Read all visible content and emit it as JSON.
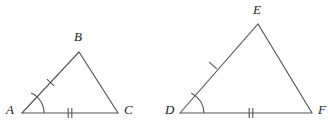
{
  "figure": {
    "canvas": {
      "width": 331,
      "height": 129
    },
    "stroke_color": "#555555",
    "label_color": "#1b1b1b",
    "background_color": "#ffffff",
    "stroke_width": 1.1
  },
  "triangles": [
    {
      "name": "triangle-abc",
      "vertices": [
        {
          "label": "A",
          "x": 22,
          "y": 113,
          "label_x": 6,
          "label_y": 103
        },
        {
          "label": "B",
          "x": 79,
          "y": 52,
          "label_x": 74,
          "label_y": 30
        },
        {
          "label": "C",
          "x": 118,
          "y": 113,
          "label_x": 124,
          "label_y": 103
        }
      ],
      "points": "22,113 79,52 118,113",
      "angle_mark": {
        "at": "A",
        "name": "angle-arc-a",
        "path": "M 44 113 A 22 22 0 0 0 31.1 92.9"
      },
      "side_marks": [
        {
          "name": "single-tick-ab",
          "side": "AB",
          "ticks": 1,
          "cx": 50.5,
          "cy": 82.5,
          "angle": -46.9
        },
        {
          "name": "double-tick-ac",
          "side": "AC",
          "ticks": 2,
          "cx": 70,
          "cy": 113,
          "angle": 0
        }
      ]
    },
    {
      "name": "triangle-def",
      "vertices": [
        {
          "label": "D",
          "x": 180,
          "y": 113,
          "label_x": 165,
          "label_y": 103
        },
        {
          "label": "E",
          "x": 258,
          "y": 24,
          "label_x": 253,
          "label_y": 3
        },
        {
          "label": "F",
          "x": 312,
          "y": 113,
          "label_x": 318,
          "label_y": 103
        }
      ],
      "points": "180,113 258,24 312,113",
      "angle_mark": {
        "at": "D",
        "name": "angle-arc-d",
        "path": "M 204 113 A 24 24 0 0 0 191.2 92.9"
      },
      "side_marks": [
        {
          "name": "single-tick-de",
          "side": "DE",
          "ticks": 1,
          "cx": 213,
          "cy": 65.5,
          "angle": -48.8
        },
        {
          "name": "double-tick-df",
          "side": "DF",
          "ticks": 2,
          "cx": 251,
          "cy": 113,
          "angle": 0
        }
      ]
    }
  ],
  "tick_style": {
    "length": 10,
    "spacing": 3.6,
    "width": 1.1
  }
}
